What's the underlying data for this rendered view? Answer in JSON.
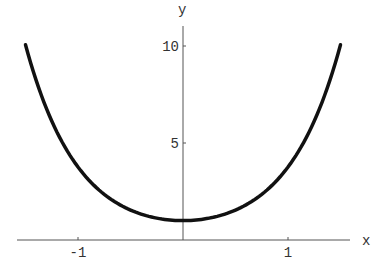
{
  "chart_data": {
    "type": "line",
    "title": "",
    "xlabel": "x",
    "ylabel": "y",
    "function": "cosh(2x)",
    "xlim": [
      -1.5,
      1.5
    ],
    "ylim": [
      0,
      10.5
    ],
    "x_ticks": [
      {
        "value": -1,
        "label": "-1"
      },
      {
        "value": 1,
        "label": "1"
      }
    ],
    "y_ticks": [
      {
        "value": 5,
        "label": "5"
      },
      {
        "value": 10,
        "label": "10"
      }
    ],
    "grid": false,
    "legend": null,
    "series": [
      {
        "name": "curve",
        "x": [
          -1.5,
          -1.25,
          -1.0,
          -0.75,
          -0.5,
          -0.25,
          0,
          0.25,
          0.5,
          0.75,
          1.0,
          1.25,
          1.5
        ],
        "values": [
          10.07,
          6.13,
          3.76,
          2.35,
          1.54,
          1.13,
          1.0,
          1.13,
          1.54,
          2.35,
          3.76,
          6.13,
          10.07
        ]
      }
    ],
    "colors": {
      "curve": "#111111",
      "axes": "#555555"
    }
  }
}
